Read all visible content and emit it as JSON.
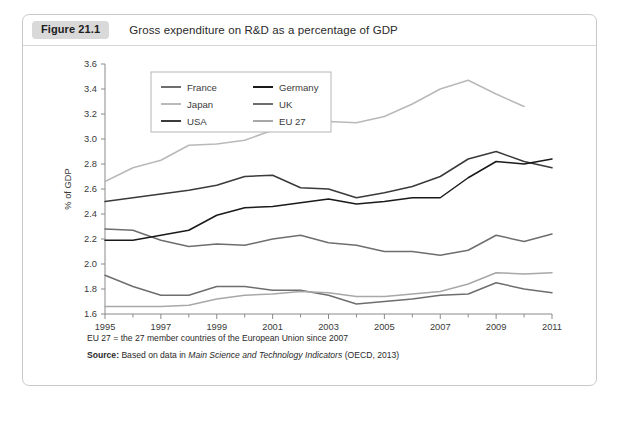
{
  "figure": {
    "badge": "Figure 21.1",
    "caption": "Gross expenditure on R&D as a percentage of GDP"
  },
  "notes": {
    "eu_note": "EU 27 = the 27 member countries of the European Union since 2007",
    "source_label": "Source:",
    "source_text_a": "Based on data in",
    "source_italic": "Main Science and Technology Indicators",
    "source_text_b": "(OECD, 2013)"
  },
  "colors": {
    "france": "#6e6e6e",
    "japan": "#b9b9b9",
    "usa": "#3a3a3a",
    "germany": "#1a1a1a",
    "uk": "#6e6e6e",
    "eu27": "#a8a8a8",
    "axis": "#8a8a8a",
    "frame": "#c9c9c9",
    "badge_bg": "#d9d9d9"
  },
  "chart_data": {
    "type": "line",
    "title": "Gross expenditure on R&D as a percentage of GDP",
    "xlabel": "",
    "ylabel": "% of GDP",
    "xlim": [
      1995,
      2011
    ],
    "ylim": [
      1.6,
      3.6
    ],
    "ytick_step": 0.2,
    "grid": false,
    "legend_position": "top-left-inside",
    "yticks": [
      "3.6",
      "3.4",
      "3.2",
      "3.0",
      "2.8",
      "2.6",
      "2.4",
      "2.2",
      "2.0",
      "1.8",
      "1.6"
    ],
    "xticks": [
      "1995",
      "1997",
      "1999",
      "2001",
      "2003",
      "2005",
      "2007",
      "2009",
      "2011"
    ],
    "x": [
      1995,
      1996,
      1997,
      1998,
      1999,
      2000,
      2001,
      2002,
      2003,
      2004,
      2005,
      2006,
      2007,
      2008,
      2009,
      2010,
      2011
    ],
    "series": [
      {
        "name": "France",
        "color": "#6e6e6e",
        "values": [
          2.28,
          2.27,
          2.19,
          2.14,
          2.16,
          2.15,
          2.2,
          2.23,
          2.17,
          2.15,
          2.1,
          2.1,
          2.07,
          2.11,
          2.23,
          2.18,
          2.24
        ]
      },
      {
        "name": "Japan",
        "color": "#b9b9b9",
        "values": [
          2.66,
          2.77,
          2.83,
          2.95,
          2.96,
          2.99,
          3.07,
          3.12,
          3.14,
          3.13,
          3.18,
          3.28,
          3.4,
          3.47,
          3.36,
          3.26,
          null
        ]
      },
      {
        "name": "USA",
        "color": "#3a3a3a",
        "values": [
          2.5,
          2.53,
          2.56,
          2.59,
          2.63,
          2.7,
          2.71,
          2.61,
          2.6,
          2.53,
          2.57,
          2.62,
          2.7,
          2.84,
          2.9,
          2.82,
          2.77
        ]
      },
      {
        "name": "Germany",
        "color": "#1a1a1a",
        "values": [
          2.19,
          2.19,
          2.23,
          2.27,
          2.39,
          2.45,
          2.46,
          2.49,
          2.52,
          2.48,
          2.5,
          2.53,
          2.53,
          2.69,
          2.82,
          2.8,
          2.84
        ]
      },
      {
        "name": "UK",
        "color": "#6e6e6e",
        "values": [
          1.91,
          1.82,
          1.75,
          1.75,
          1.82,
          1.82,
          1.79,
          1.79,
          1.75,
          1.68,
          1.7,
          1.72,
          1.75,
          1.76,
          1.85,
          1.8,
          1.77
        ]
      },
      {
        "name": "EU 27",
        "color": "#a8a8a8",
        "values": [
          1.66,
          1.66,
          1.66,
          1.67,
          1.72,
          1.75,
          1.76,
          1.78,
          1.77,
          1.74,
          1.74,
          1.76,
          1.78,
          1.84,
          1.93,
          1.92,
          1.93
        ]
      }
    ]
  }
}
